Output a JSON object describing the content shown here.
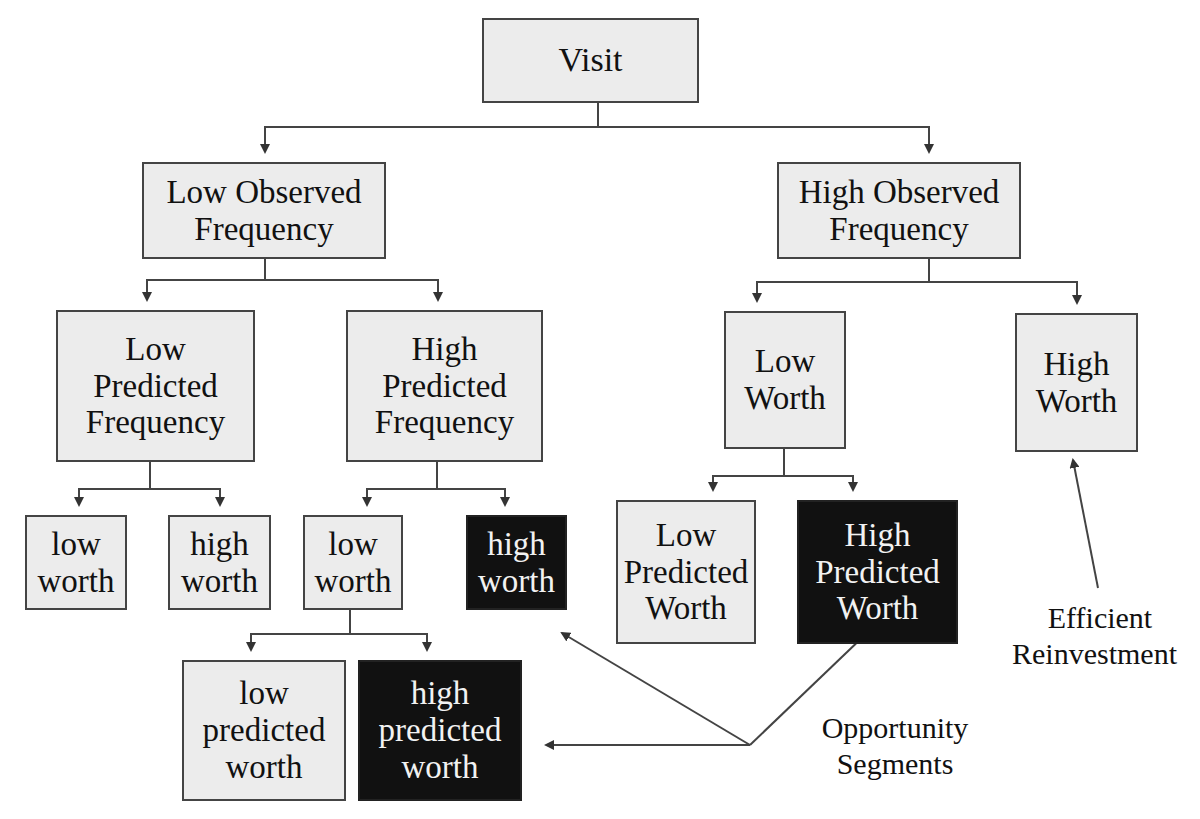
{
  "diagram": {
    "type": "tree",
    "nodes": {
      "root": {
        "lines": [
          "Visit"
        ]
      },
      "low_observed": {
        "lines": [
          "Low Observed",
          "Frequency"
        ]
      },
      "high_observed": {
        "lines": [
          "High Observed",
          "Frequency"
        ]
      },
      "low_predicted_freq": {
        "lines": [
          "Low",
          "Predicted",
          "Frequency"
        ]
      },
      "high_predicted_freq": {
        "lines": [
          "High",
          "Predicted",
          "Frequency"
        ]
      },
      "low_worth_cap": {
        "lines": [
          "Low",
          "Worth"
        ]
      },
      "high_worth_cap": {
        "lines": [
          "High",
          "Worth"
        ]
      },
      "lpf_low_worth": {
        "lines": [
          "low",
          "worth"
        ]
      },
      "lpf_high_worth": {
        "lines": [
          "high",
          "worth"
        ]
      },
      "hpf_low_worth": {
        "lines": [
          "low",
          "worth"
        ]
      },
      "hpf_high_worth": {
        "lines": [
          "high",
          "worth"
        ],
        "highlighted": true
      },
      "lw_low_predicted_worth": {
        "lines": [
          "Low",
          "Predicted",
          "Worth"
        ]
      },
      "lw_high_predicted_worth": {
        "lines": [
          "High",
          "Predicted",
          "Worth"
        ],
        "highlighted": true
      },
      "hlw_low_predicted_worth": {
        "lines": [
          "low",
          "predicted",
          "worth"
        ]
      },
      "hlw_high_predicted_worth": {
        "lines": [
          "high",
          "predicted",
          "worth"
        ],
        "highlighted": true
      }
    },
    "annotations": {
      "opportunity": {
        "lines": [
          "Opportunity",
          "Segments"
        ]
      },
      "reinvestment": {
        "lines": [
          "Efficient",
          "Reinvestment"
        ]
      }
    },
    "colors": {
      "box_fill": "#ececec",
      "highlight_fill": "#111111",
      "line": "#333333"
    }
  }
}
